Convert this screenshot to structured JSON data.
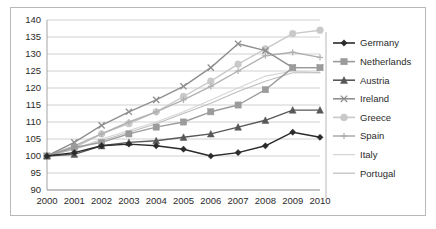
{
  "chart_data": {
    "type": "line",
    "title": "",
    "subtitle": "",
    "xlabel": "",
    "ylabel": "",
    "categories": [
      "2000",
      "2001",
      "2002",
      "2003",
      "2004",
      "2005",
      "2006",
      "2007",
      "2008",
      "2009",
      "2010"
    ],
    "ylim": [
      90,
      140
    ],
    "ytick_step": 5,
    "yticks": [
      "140",
      "135",
      "130",
      "125",
      "120",
      "115",
      "110",
      "105",
      "100",
      "95",
      "90"
    ],
    "grid": true,
    "legend_position": "right",
    "series": [
      {
        "name": "Germany",
        "color": "#2b2b2b",
        "marker": "diamond",
        "values": [
          100,
          101,
          103,
          103.5,
          103,
          102,
          100,
          101,
          103,
          107,
          105.5
        ]
      },
      {
        "name": "Netherlands",
        "color": "#9b9b9b",
        "marker": "square",
        "values": [
          100,
          102.5,
          104,
          106.5,
          108.5,
          110,
          113,
          115,
          119.5,
          126,
          126
        ]
      },
      {
        "name": "Austria",
        "color": "#585858",
        "marker": "triangle",
        "values": [
          100,
          100.5,
          103,
          104,
          104.5,
          105.5,
          106.5,
          108.5,
          110.5,
          113.5,
          113.5
        ]
      },
      {
        "name": "Ireland",
        "color": "#8f8f8f",
        "marker": "cross",
        "values": [
          100,
          104,
          109,
          113,
          116.5,
          120.5,
          126,
          133,
          131,
          126,
          126
        ]
      },
      {
        "name": "Greece",
        "color": "#c9c9c9",
        "marker": "circle",
        "values": [
          100,
          102.5,
          106.5,
          109.5,
          113,
          117.5,
          122,
          127,
          131.5,
          136,
          137
        ]
      },
      {
        "name": "Spain",
        "color": "#b0b0b0",
        "marker": "plus",
        "values": [
          100,
          103,
          106.5,
          110,
          113,
          116.5,
          120.5,
          125,
          129.5,
          130.5,
          129
        ]
      },
      {
        "name": "Italy",
        "color": "#d5d5d5",
        "marker": "none",
        "values": [
          100,
          102,
          105,
          107.5,
          110,
          113,
          116.5,
          120,
          123.5,
          125,
          124.5
        ]
      },
      {
        "name": "Portugal",
        "color": "#bdbdbd",
        "marker": "none",
        "values": [
          100,
          102,
          104.5,
          107,
          109.5,
          112.5,
          115.5,
          119,
          122,
          124.5,
          124.5
        ]
      }
    ]
  }
}
